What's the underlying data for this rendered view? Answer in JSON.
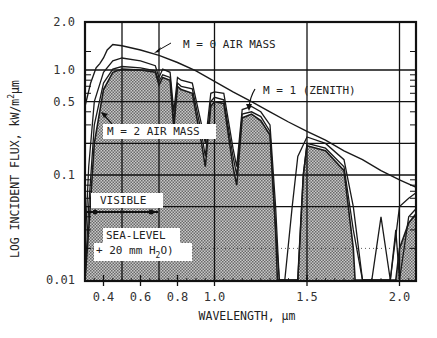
{
  "chart_data": {
    "type": "area",
    "title": "",
    "xlabel": "WAVELENGTH, µm",
    "ylabel": "LOG INCIDENT FLUX, kW/m²µm",
    "ylabel_parts": {
      "main": "LOG INCIDENT FLUX, kW/m",
      "sup": "2",
      "tail": "µm"
    },
    "yscale": "log",
    "xlim": [
      0.3,
      2.1
    ],
    "ylim": [
      0.01,
      2.0
    ],
    "grid": true,
    "x_ticks": [
      {
        "value": 0.4,
        "label": "0.4"
      },
      {
        "value": 0.6,
        "label": "0.6"
      },
      {
        "value": 0.8,
        "label": "0.8"
      },
      {
        "value": 1.0,
        "label": "1.0"
      },
      {
        "value": 1.5,
        "label": "1.5"
      },
      {
        "value": 2.0,
        "label": "2.0"
      }
    ],
    "y_ticks": [
      {
        "value": 2.0,
        "label": "2.0"
      },
      {
        "value": 1.0,
        "label": "1.0"
      },
      {
        "value": 0.5,
        "label": "0.5"
      },
      {
        "value": 0.1,
        "label": "0.1"
      },
      {
        "value": 0.01,
        "label": "0.01"
      }
    ],
    "series": [
      {
        "name": "M = 0 AIR MASS",
        "x": [
          0.3,
          0.33,
          0.36,
          0.38,
          0.4,
          0.42,
          0.45,
          0.5,
          0.6,
          0.7,
          0.8,
          0.9,
          1.0,
          1.1,
          1.2,
          1.3,
          1.4,
          1.5,
          1.6,
          1.7,
          1.8,
          1.9,
          2.0,
          2.1
        ],
        "values": [
          0.45,
          0.75,
          1.05,
          1.15,
          1.3,
          1.55,
          1.75,
          1.7,
          1.55,
          1.38,
          1.18,
          0.98,
          0.78,
          0.62,
          0.5,
          0.4,
          0.32,
          0.26,
          0.215,
          0.17,
          0.14,
          0.11,
          0.09,
          0.075
        ]
      },
      {
        "name": "M = 1 (ZENITH)",
        "x": [
          0.3,
          0.32,
          0.35,
          0.4,
          0.45,
          0.5,
          0.6,
          0.68,
          0.7,
          0.72,
          0.76,
          0.78,
          0.8,
          0.82,
          0.88,
          0.93,
          0.95,
          0.98,
          1.0,
          1.05,
          1.1,
          1.12,
          1.15,
          1.2,
          1.25,
          1.3,
          1.33,
          1.35,
          1.38,
          1.42,
          1.45,
          1.5,
          1.6,
          1.7,
          1.75,
          1.8,
          1.85,
          1.9,
          1.95,
          2.0,
          2.05,
          2.1
        ],
        "values": [
          0.02,
          0.12,
          0.5,
          0.95,
          1.22,
          1.3,
          1.22,
          1.1,
          0.85,
          1.02,
          0.95,
          0.4,
          0.85,
          0.8,
          0.75,
          0.3,
          0.2,
          0.6,
          0.62,
          0.6,
          0.18,
          0.12,
          0.42,
          0.45,
          0.4,
          0.3,
          0.05,
          0.01,
          0.01,
          0.05,
          0.15,
          0.23,
          0.2,
          0.14,
          0.05,
          0.01,
          0.01,
          0.04,
          0.01,
          0.05,
          0.06,
          0.07
        ]
      },
      {
        "name": "M = 2 AIR MASS",
        "x": [
          0.3,
          0.32,
          0.35,
          0.4,
          0.45,
          0.5,
          0.6,
          0.68,
          0.7,
          0.72,
          0.76,
          0.78,
          0.8,
          0.82,
          0.88,
          0.93,
          0.95,
          0.98,
          1.0,
          1.05,
          1.1,
          1.12,
          1.15,
          1.2,
          1.25,
          1.3,
          1.33,
          1.35,
          1.38,
          1.45,
          1.48,
          1.5,
          1.6,
          1.7,
          1.75,
          1.8,
          1.95,
          1.98,
          2.0,
          2.05,
          2.1
        ],
        "values": [
          0.01,
          0.05,
          0.3,
          0.75,
          1.02,
          1.08,
          1.05,
          0.98,
          0.78,
          0.9,
          0.85,
          0.32,
          0.75,
          0.7,
          0.66,
          0.25,
          0.15,
          0.5,
          0.55,
          0.52,
          0.15,
          0.1,
          0.38,
          0.4,
          0.36,
          0.26,
          0.03,
          0.01,
          0.01,
          0.01,
          0.1,
          0.2,
          0.18,
          0.12,
          0.03,
          0.01,
          0.01,
          0.03,
          0.01,
          0.04,
          0.05
        ]
      },
      {
        "name": "SEA-LEVEL (+ 20 mm H2O)",
        "style": "shaded",
        "x": [
          0.3,
          0.32,
          0.35,
          0.4,
          0.45,
          0.5,
          0.6,
          0.68,
          0.7,
          0.72,
          0.76,
          0.78,
          0.8,
          0.82,
          0.88,
          0.93,
          0.95,
          0.98,
          1.0,
          1.05,
          1.1,
          1.12,
          1.15,
          1.2,
          1.25,
          1.3,
          1.33,
          1.34,
          1.45,
          1.48,
          1.5,
          1.6,
          1.7,
          1.75,
          1.76,
          1.98,
          2.0,
          2.05,
          2.1
        ],
        "values": [
          0.01,
          0.03,
          0.2,
          0.65,
          0.95,
          1.02,
          1.0,
          0.95,
          0.72,
          0.85,
          0.8,
          0.28,
          0.7,
          0.65,
          0.6,
          0.2,
          0.12,
          0.45,
          0.5,
          0.48,
          0.12,
          0.08,
          0.35,
          0.38,
          0.33,
          0.24,
          0.03,
          0.01,
          0.01,
          0.1,
          0.19,
          0.17,
          0.11,
          0.02,
          0.01,
          0.01,
          0.02,
          0.035,
          0.045
        ]
      }
    ],
    "annotations": [
      {
        "text": "M = 0 AIR MASS",
        "points_to": [
          0.72,
          1.35
        ]
      },
      {
        "text": "M = 1 (ZENITH)",
        "points_to": [
          1.02,
          0.6
        ]
      },
      {
        "text": "M = 2 AIR MASS",
        "points_to": [
          0.4,
          0.45
        ]
      },
      {
        "text": "VISIBLE",
        "range": [
          0.38,
          0.76
        ]
      },
      {
        "text": "SEA-LEVEL",
        "line2": "+ 20 mm H2O)"
      }
    ],
    "legend": "none (inline annotations)"
  },
  "labels": {
    "m0": "M = 0 AIR MASS",
    "m1": "M = 1 (ZENITH)",
    "m2": "M = 2 AIR MASS",
    "visible": "VISIBLE",
    "sea_level": "SEA-LEVEL",
    "h2o_prefix": "+ 20 mm H",
    "h2o_sub": "2",
    "h2o_suffix": "O)",
    "xlabel": "WAVELENGTH, µm",
    "ylabel_main": "LOG INCIDENT FLUX, kW/m",
    "ylabel_sup": "2",
    "ylabel_tail": "µm"
  },
  "colors": {
    "ink": "#1a1a1a",
    "shade": "#9a9a9a",
    "background": "#ffffff"
  }
}
